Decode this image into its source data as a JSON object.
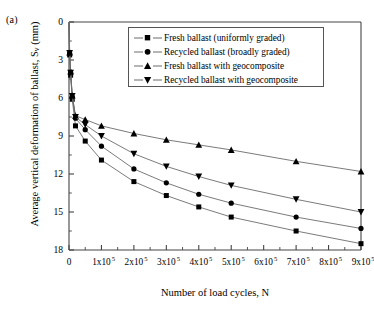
{
  "panel": {
    "label": "(a)"
  },
  "axes": {
    "ylabel_pre": "Average vertical deformation of ballast, S",
    "ylabel_sub": "v",
    "ylabel_post": " (mm)",
    "xlabel": "Number of load cycles, N",
    "y_ticks": [
      "0",
      "3",
      "6",
      "9",
      "12",
      "15",
      "18"
    ],
    "x_ticks": [
      "0",
      "1x10",
      "2x10",
      "3x10",
      "4x10",
      "5x10",
      "6x10",
      "7x10",
      "8x10",
      "9x10"
    ],
    "x_exponent": "5"
  },
  "legend": {
    "items": [
      {
        "label": "Fresh ballast (uniformly graded)",
        "marker": "square"
      },
      {
        "label": "Recycled ballast (broadly graded)",
        "marker": "circle"
      },
      {
        "label": "Fresh ballast with geocomposite",
        "marker": "triangle-up"
      },
      {
        "label": "Recycled ballast with geocomposite",
        "marker": "triangle-down"
      }
    ]
  },
  "style": {
    "line_color": "#6b6b6b",
    "marker_color": "#000000",
    "axis_color": "#444444"
  },
  "chart_data": {
    "type": "line",
    "title": "",
    "xlabel": "Number of load cycles, N",
    "ylabel": "Average vertical deformation of ballast, Sv (mm)",
    "xlim": [
      0,
      900000
    ],
    "ylim": [
      0,
      18
    ],
    "y_inverted": true,
    "grid": false,
    "legend_position": "top-right",
    "x_tick_values": [
      0,
      100000,
      200000,
      300000,
      400000,
      500000,
      600000,
      700000,
      800000,
      900000
    ],
    "y_tick_values": [
      0,
      3,
      6,
      9,
      12,
      15,
      18
    ],
    "series": [
      {
        "name": "Fresh ballast (uniformly graded)",
        "marker": "square",
        "x": [
          0,
          2000,
          5000,
          10000,
          20000,
          50000,
          100000,
          200000,
          300000,
          400000,
          500000,
          700000,
          900000
        ],
        "values": [
          0,
          2.6,
          4.2,
          6.1,
          8.2,
          9.4,
          10.9,
          12.6,
          13.7,
          14.6,
          15.4,
          16.5,
          17.5
        ]
      },
      {
        "name": "Recycled ballast (broadly graded)",
        "marker": "circle",
        "x": [
          0,
          2000,
          5000,
          10000,
          20000,
          50000,
          100000,
          200000,
          300000,
          400000,
          500000,
          700000,
          900000
        ],
        "values": [
          0,
          2.5,
          4.0,
          5.9,
          7.6,
          8.5,
          9.8,
          11.6,
          12.7,
          13.6,
          14.3,
          15.4,
          16.3
        ]
      },
      {
        "name": "Fresh ballast with geocomposite",
        "marker": "triangle-up",
        "x": [
          0,
          2000,
          5000,
          10000,
          20000,
          50000,
          100000,
          200000,
          300000,
          400000,
          500000,
          700000,
          900000
        ],
        "values": [
          0,
          2.4,
          3.9,
          5.8,
          7.4,
          7.7,
          8.2,
          8.8,
          9.3,
          9.7,
          10.1,
          11.0,
          11.8
        ]
      },
      {
        "name": "Recycled ballast with geocomposite",
        "marker": "triangle-down",
        "x": [
          0,
          2000,
          5000,
          10000,
          20000,
          50000,
          100000,
          200000,
          300000,
          400000,
          500000,
          700000,
          900000
        ],
        "values": [
          0,
          2.45,
          4.0,
          5.85,
          7.5,
          8.1,
          9.0,
          10.4,
          11.4,
          12.2,
          12.9,
          14.0,
          15.0
        ]
      }
    ]
  }
}
